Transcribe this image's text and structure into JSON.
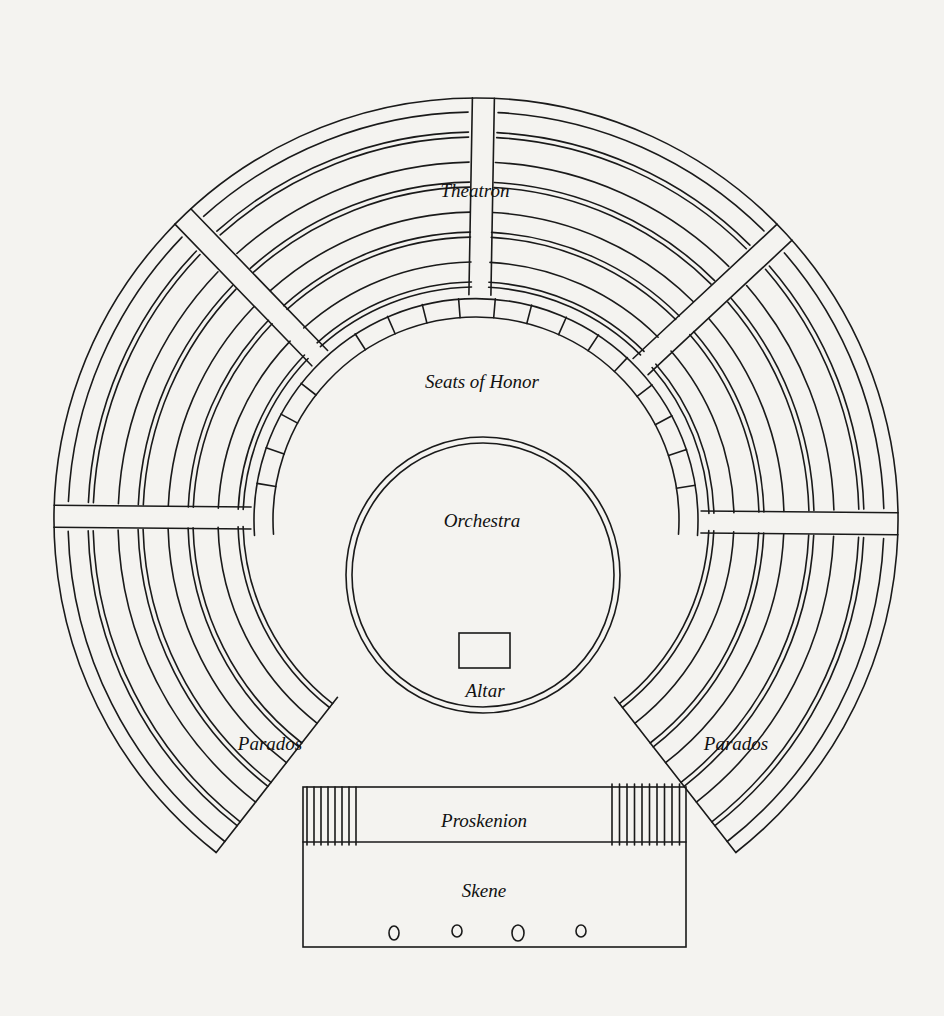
{
  "diagram": {
    "type": "greek-theatre-plan",
    "labels": {
      "theatron": "Theatron",
      "seats_of_honor": "Seats of Honor",
      "orchestra": "Orchestra",
      "altar": "Altar",
      "parados_left": "Parados",
      "parados_right": "Parados",
      "proskenion": "Proskenion",
      "skene": "Skene"
    },
    "colors": {
      "ink": "#1a1a1a",
      "paper": "#f4f3f0"
    },
    "skene_doors": 4
  }
}
